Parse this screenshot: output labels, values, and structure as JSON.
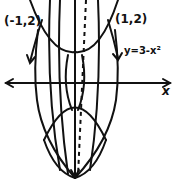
{
  "diagram": {
    "type": "hand-drawn solid of revolution sketch",
    "labels": {
      "point_left": "(-1,2)",
      "point_right": "(1,2)",
      "curve_label": "y=3-x²",
      "x_axis": "x"
    },
    "colors": {
      "ink": "#111111",
      "background": "#ffffff"
    }
  }
}
